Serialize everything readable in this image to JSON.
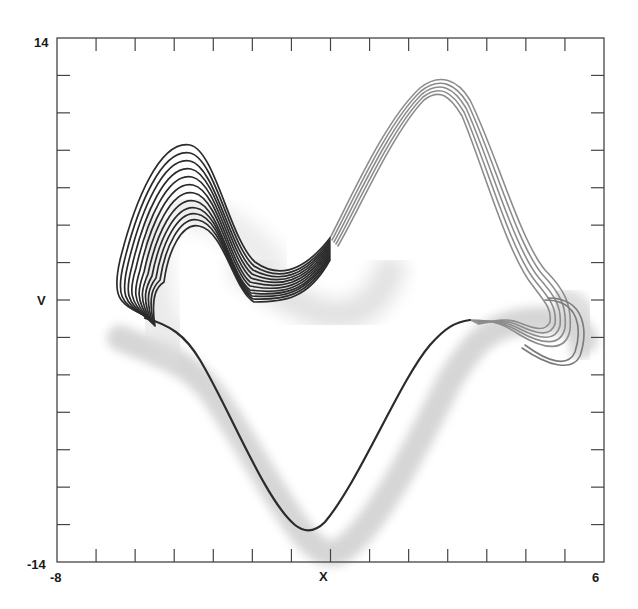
{
  "chart_data": {
    "type": "line",
    "title": "",
    "xlabel": "X",
    "ylabel": "V",
    "xlim": [
      -8,
      6
    ],
    "ylim": [
      -14,
      14
    ],
    "x_tick_labels": [
      "-8",
      "6"
    ],
    "y_tick_labels": [
      "14",
      "-14"
    ],
    "x_tick_step": 1,
    "y_tick_step": 2,
    "grid": false,
    "legend": null,
    "series": [
      {
        "name": "trajectory bundle (dark)",
        "color": "#2b2b2b",
        "strands": 12,
        "points_xy": [
          [
            -6.8,
            0.2
          ],
          [
            -6.5,
            5.0
          ],
          [
            -5.8,
            8.2
          ],
          [
            -5.0,
            9.5
          ],
          [
            -4.2,
            8.2
          ],
          [
            -3.2,
            4.6
          ],
          [
            -2.2,
            3.0
          ],
          [
            -1.5,
            4.0
          ],
          [
            -0.6,
            6.5
          ],
          [
            0.5,
            11.5
          ],
          [
            1.6,
            12.8
          ],
          [
            2.5,
            11.0
          ],
          [
            3.4,
            5.4
          ],
          [
            4.5,
            1.6
          ],
          [
            5.3,
            -0.3
          ],
          [
            5.4,
            -2.3
          ],
          [
            4.6,
            -2.7
          ],
          [
            3.9,
            -0.8
          ],
          [
            2.9,
            -0.5
          ],
          [
            1.4,
            -3.8
          ],
          [
            0.0,
            -8.5
          ],
          [
            -1.1,
            -12.3
          ],
          [
            -2.1,
            -11.5
          ],
          [
            -3.4,
            -7.4
          ],
          [
            -4.7,
            -2.2
          ],
          [
            -6.0,
            -1.3
          ],
          [
            -6.8,
            0.2
          ]
        ]
      },
      {
        "name": "probability cloud (light gray)",
        "color": "#c8c8c8",
        "points_xy": [
          [
            -6.4,
            -1.9
          ],
          [
            -4.5,
            -4.0
          ],
          [
            -3.0,
            -8.0
          ],
          [
            -1.8,
            -12.0
          ],
          [
            -1.0,
            -13.6
          ],
          [
            0.0,
            -12.5
          ],
          [
            1.5,
            -7.8
          ],
          [
            2.8,
            -2.4
          ],
          [
            3.8,
            0.2
          ],
          [
            5.3,
            0.6
          ],
          [
            5.9,
            -1.2
          ],
          [
            5.5,
            -3.4
          ]
        ]
      }
    ]
  }
}
